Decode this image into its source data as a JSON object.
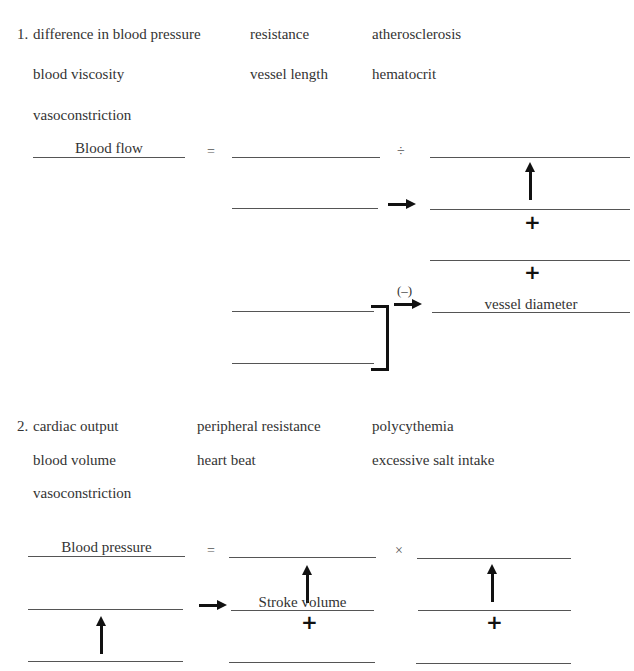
{
  "section1": {
    "number": "1.",
    "terms": [
      [
        "difference in blood pressure",
        "resistance",
        "atherosclerosis"
      ],
      [
        "blood viscosity",
        "vessel length",
        "hematocrit"
      ],
      [
        "vasoconstriction",
        "",
        ""
      ]
    ],
    "equation": {
      "lhs_label": "Blood flow",
      "equals": "=",
      "operator": "÷",
      "plus": "+",
      "negative_label": "(–)",
      "filled_label": "vessel diameter"
    }
  },
  "section2": {
    "number": "2.",
    "terms": [
      [
        "cardiac output",
        "peripheral resistance",
        "polycythemia"
      ],
      [
        "blood volume",
        "heart beat",
        "excessive salt intake"
      ],
      [
        "vasoconstriction",
        "",
        ""
      ]
    ],
    "equation": {
      "lhs_label": "Blood pressure",
      "equals": "=",
      "operator": "×",
      "plus": "+",
      "filled_label": "Stroke volume"
    }
  }
}
